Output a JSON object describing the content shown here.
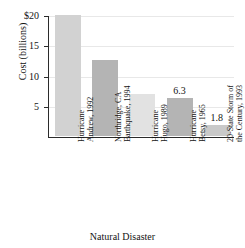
{
  "chart_data": {
    "type": "bar",
    "title": "",
    "xlabel": "Natural Disaster",
    "ylabel": "Cost (billions)",
    "categories": [
      "Hurricane Andrew, 1992",
      "Northridge, CA Earthquake, 1994",
      "Hurricane Hugo, 1989",
      "Hurricane Betsy, 1965",
      "20-State Storm of the Century, 1993"
    ],
    "values": [
      20,
      12.5,
      7,
      6.3,
      1.8
    ],
    "ylim": [
      0,
      20
    ],
    "yticks": [
      5,
      10,
      15,
      20
    ],
    "ytick_labels": [
      "5",
      "10",
      "15",
      "$20"
    ],
    "grid": true,
    "legend": "none"
  },
  "axes": {
    "y_title": "Cost (billions)",
    "x_title": "Natural Disaster",
    "y_ticks": [
      {
        "label": "$20",
        "value": 20
      },
      {
        "label": "15",
        "value": 15
      },
      {
        "label": "10",
        "value": 10
      },
      {
        "label": "5",
        "value": 5
      }
    ]
  },
  "bars": [
    {
      "line1": "Hurricane",
      "line2": "Andrew, 1992",
      "value": 20,
      "value_label": "",
      "color": "#d2d2d2"
    },
    {
      "line1": "Northridge, CA",
      "line2": "Earthquake, 1994",
      "value": 12.5,
      "value_label": "",
      "color": "#b4b4b4"
    },
    {
      "line1": "Hurricane",
      "line2": "Hugo, 1989",
      "value": 7,
      "value_label": "",
      "color": "#e2e2e2"
    },
    {
      "line1": "Hurricane",
      "line2": "Betsy, 1965",
      "value": 6.3,
      "value_label": "6.3",
      "color": "#b4b4b4"
    },
    {
      "line1": "20-State Storm of",
      "line2": "the Century, 1993",
      "value": 1.8,
      "value_label": "1.8",
      "color": "#c9c9c9"
    }
  ]
}
